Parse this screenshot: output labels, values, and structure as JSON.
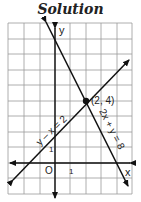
{
  "title": "Solution",
  "graph": {
    "grid_unit_px": 15.5,
    "axes": {
      "x_label": "x",
      "y_label": "y",
      "origin_label": "O",
      "x_tick_label": "1",
      "y_tick_label": "1"
    },
    "lines": [
      {
        "equation": "2x + y = 8",
        "label": "2x + y = 8"
      },
      {
        "equation": "y - x = 2",
        "label": "y – x = 2"
      }
    ],
    "intersection": {
      "x": 2,
      "y": 4,
      "label": "(2, 4)"
    }
  }
}
